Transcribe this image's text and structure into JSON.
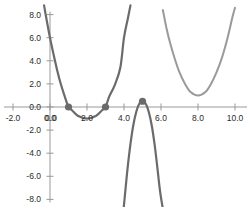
{
  "chart_data": {
    "type": "line",
    "title": "",
    "xlabel": "",
    "ylabel": "",
    "xlim": [
      -2.6,
      11.2
    ],
    "ylim": [
      -8.8,
      8.8
    ],
    "grid": false,
    "legend": null,
    "axis": {
      "x_ticks": [
        -2.0,
        0.0,
        2.0,
        4.0,
        6.0,
        8.0,
        10.0
      ],
      "x_tick_labels": [
        "-2.0",
        "0.0",
        "2.0",
        "4.0",
        "6.0",
        "8.0",
        "10.0"
      ],
      "y_ticks": [
        -8.0,
        -6.0,
        -4.0,
        -2.0,
        0.0,
        2.0,
        4.0,
        6.0,
        8.0
      ],
      "y_tick_labels": [
        "-8.0",
        "-6.0",
        "-4.0",
        "-2.0",
        "0.0",
        "2.0",
        "4.0",
        "6.0",
        "8.0"
      ],
      "origin_label": "0.0",
      "axis_color": "#999999",
      "tick_color": "#999999",
      "label_color": "#2b2b2b"
    },
    "series": [
      {
        "name": "upward-parabola-left",
        "color": "#6b6b6b",
        "style": "solid",
        "width": 2.2,
        "equation": "y = 2(x-1)(x-3)",
        "x_range": [
          -0.32,
          4.35
        ],
        "points": [
          [
            -0.32,
            8.8
          ],
          [
            -0.2,
            7.7
          ],
          [
            0.0,
            6.0
          ],
          [
            0.2,
            4.5
          ],
          [
            0.4,
            3.1
          ],
          [
            0.6,
            1.9
          ],
          [
            0.8,
            0.9
          ],
          [
            1.0,
            0.0
          ],
          [
            1.2,
            -0.3
          ],
          [
            1.5,
            -0.75
          ],
          [
            2.0,
            -1.0
          ],
          [
            2.5,
            -0.75
          ],
          [
            2.8,
            -0.3
          ],
          [
            3.0,
            0.0
          ],
          [
            3.2,
            0.9
          ],
          [
            3.5,
            1.9
          ],
          [
            3.8,
            3.4
          ],
          [
            4.0,
            6.0
          ],
          [
            4.2,
            7.6
          ],
          [
            4.35,
            8.8
          ]
        ]
      },
      {
        "name": "downward-parabola-middle",
        "color": "#6b6b6b",
        "style": "solid",
        "width": 2.2,
        "equation": "y = -9(x-5)^2 + 0.5",
        "x_range": [
          3.98,
          6.1
        ],
        "points": [
          [
            3.98,
            -8.8
          ],
          [
            4.1,
            -6.8
          ],
          [
            4.2,
            -5.2
          ],
          [
            4.35,
            -3.2
          ],
          [
            4.5,
            -1.6
          ],
          [
            4.65,
            -0.5
          ],
          [
            4.8,
            0.2
          ],
          [
            5.0,
            0.5
          ],
          [
            5.2,
            0.2
          ],
          [
            5.35,
            -0.5
          ],
          [
            5.5,
            -1.6
          ],
          [
            5.65,
            -3.2
          ],
          [
            5.8,
            -5.2
          ],
          [
            5.95,
            -7.3
          ],
          [
            6.1,
            -8.8
          ]
        ]
      },
      {
        "name": "upward-parabola-right",
        "color": "#9a9a9a",
        "style": "solid",
        "width": 2.0,
        "equation": "y = 2(x-8)^2 + 1",
        "x_range": [
          6.1,
          10.0
        ],
        "points": [
          [
            6.1,
            8.4
          ],
          [
            6.3,
            6.8
          ],
          [
            6.5,
            5.5
          ],
          [
            6.8,
            3.9
          ],
          [
            7.0,
            3.0
          ],
          [
            7.3,
            2.0
          ],
          [
            7.6,
            1.3
          ],
          [
            8.0,
            1.0
          ],
          [
            8.4,
            1.3
          ],
          [
            8.7,
            2.0
          ],
          [
            9.0,
            3.0
          ],
          [
            9.3,
            4.3
          ],
          [
            9.6,
            6.0
          ],
          [
            9.85,
            7.7
          ],
          [
            10.0,
            8.6
          ]
        ]
      }
    ],
    "markers": [
      {
        "name": "root-left",
        "x": 1.0,
        "y": 0.0,
        "color": "#6b6b6b",
        "size": 3.6
      },
      {
        "name": "root-right",
        "x": 3.0,
        "y": 0.0,
        "color": "#6b6b6b",
        "size": 3.6
      },
      {
        "name": "vertex-max",
        "x": 5.0,
        "y": 0.5,
        "color": "#6b6b6b",
        "size": 3.6
      }
    ]
  }
}
